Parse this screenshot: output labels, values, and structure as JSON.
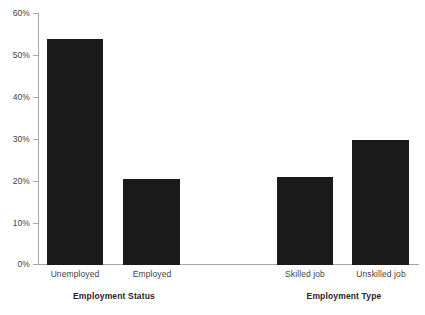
{
  "chart_data": {
    "type": "bar",
    "title": "",
    "subtitle": "",
    "xlabel": "",
    "ylabel": "",
    "ylim": [
      0,
      60
    ],
    "y_unit": "%",
    "grid": false,
    "legend": null,
    "bar_color": "#1a1a1a",
    "axis_color": "#a6a6a6",
    "text_color": "#3f3f3f",
    "categories": [
      "Unemployed",
      "Employed",
      "Skilled job",
      "Unskilled job"
    ],
    "values": [
      54,
      20.5,
      21,
      30
    ],
    "ytick_labels": [
      "60%",
      "50%",
      "40%",
      "30%",
      "20%",
      "10%",
      "0%"
    ],
    "ytick_values": [
      60,
      50,
      40,
      30,
      20,
      10,
      0
    ],
    "groups": [
      {
        "title": "Employment Status",
        "categories": [
          "Unemployed",
          "Employed"
        ]
      },
      {
        "title": "Employment Type",
        "categories": [
          "Skilled job",
          "Unskilled job"
        ]
      }
    ],
    "group_titles": [
      "Employment Status",
      "Employment Type"
    ]
  }
}
